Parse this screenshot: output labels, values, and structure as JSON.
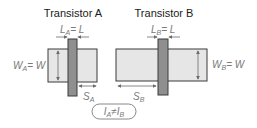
{
  "diagram": {
    "transistor_a": {
      "title": "Transistor A",
      "length_label": "L",
      "length_sub": "A",
      "length_eq": "= L",
      "width_label": "W",
      "width_sub": "A",
      "width_eq": "= W",
      "spacing_label": "S",
      "spacing_sub": "A"
    },
    "transistor_b": {
      "title": "Transistor B",
      "length_label": "L",
      "length_sub": "B",
      "length_eq": "= L",
      "width_label": "W",
      "width_sub": "B",
      "width_eq": "= W",
      "spacing_label": "S",
      "spacing_sub": "B"
    },
    "relation": {
      "lhs": "I",
      "lhs_sub": "A",
      "op": "≠",
      "rhs": "I",
      "rhs_sub": "B"
    },
    "colors": {
      "active_fill": "#e6e6e6",
      "gate_fill": "#8f8f8f",
      "outline": "#3a3a3a",
      "label": "#7a7a7a"
    }
  }
}
